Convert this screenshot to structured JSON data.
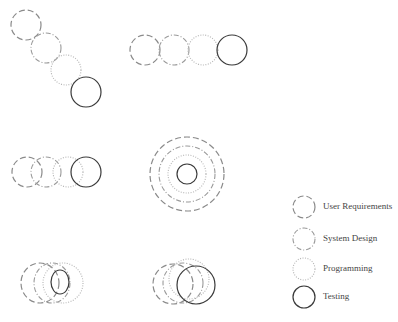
{
  "legend": {
    "items": [
      {
        "key": "user_requirements",
        "label": "User Requirements",
        "style": "long-dash"
      },
      {
        "key": "system_design",
        "label": "System Design",
        "style": "dash-dot"
      },
      {
        "key": "programming",
        "label": "Programming",
        "style": "dotted"
      },
      {
        "key": "testing",
        "label": "Testing",
        "style": "solid"
      }
    ]
  },
  "diagrams": [
    {
      "name": "diagonal-sequence",
      "layout": "diagonal cascade"
    },
    {
      "name": "horizontal-sequence",
      "layout": "horizontal tangent row"
    },
    {
      "name": "overlapping-row",
      "layout": "horizontal overlapping row"
    },
    {
      "name": "concentric",
      "layout": "concentric rings"
    },
    {
      "name": "interleaved-ellipses",
      "layout": "overlapping ellipses"
    },
    {
      "name": "offset-overlap",
      "layout": "offset overlapping circles"
    }
  ],
  "colors": {
    "user_requirements": "#8a8a8a",
    "system_design": "#9a9a9a",
    "programming": "#b4b4b4",
    "testing": "#3a3a3a"
  }
}
